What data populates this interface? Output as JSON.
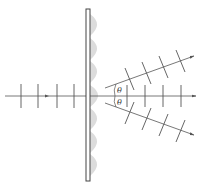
{
  "diagram": {
    "title": "",
    "colors": {
      "line": "#555555",
      "grating_fill": "#ffffff",
      "grating_stroke": "#444444",
      "lobe": "#d9d9d9"
    },
    "labels": {
      "theta_upper": "θ",
      "theta_lower": "θ"
    },
    "grating": {
      "x": 86,
      "y": 9,
      "width": 4,
      "height": 172
    },
    "axis": {
      "y": 96,
      "x_start": 5,
      "x_end": 196
    },
    "incoming_wavefront_x": [
      21,
      38,
      57,
      74
    ],
    "outgoing_zero_order_x": [
      127,
      145,
      163,
      181
    ],
    "beams": [
      {
        "name": "upper-first-order",
        "x1": 105,
        "y1": 88,
        "x2": 194,
        "y2": 56
      },
      {
        "name": "lower-first-order",
        "x1": 105,
        "y1": 103,
        "x2": 194,
        "y2": 135
      }
    ]
  }
}
